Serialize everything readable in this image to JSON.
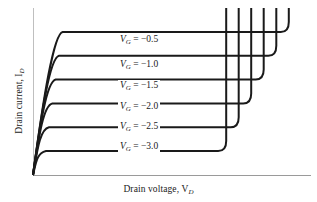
{
  "figure": {
    "x_axis_title_text": "Drain voltage, V",
    "x_axis_title_sub": "D",
    "y_axis_title_text": "Drain current, I",
    "y_axis_title_sub": "D"
  },
  "chart_data": {
    "type": "line",
    "title": "",
    "subtitle": "",
    "xlabel": "Drain voltage, V_D",
    "ylabel": "Drain current, I_D",
    "xlim": [
      0,
      10
    ],
    "ylim": [
      0,
      7
    ],
    "grid": false,
    "legend_position": "inline-annotations",
    "axis_ticks": [],
    "annotations": [
      {
        "label_var": "V",
        "label_sub": "G",
        "label_eq": " = ",
        "value": "−0.5"
      },
      {
        "label_var": "V",
        "label_sub": "G",
        "label_eq": " = ",
        "value": "−1.0"
      },
      {
        "label_var": "V",
        "label_sub": "G",
        "label_eq": " = ",
        "value": "−1.5"
      },
      {
        "label_var": "V",
        "label_sub": "G",
        "label_eq": " = ",
        "value": "−2.0"
      },
      {
        "label_var": "V",
        "label_sub": "G",
        "label_eq": " = ",
        "value": "−2.5"
      },
      {
        "label_var": "V",
        "label_sub": "G",
        "label_eq": " = ",
        "value": "−3.0"
      }
    ],
    "series": [
      {
        "name": "V_G = -0.5",
        "gate_voltage": -0.5,
        "saturation_current": 6.0,
        "knee_voltage": 0.85,
        "breakdown_voltage": 9.2,
        "color": "#1a1a1a"
      },
      {
        "name": "V_G = -1.0",
        "gate_voltage": -1.0,
        "saturation_current": 5.0,
        "knee_voltage": 0.72,
        "breakdown_voltage": 8.75,
        "color": "#1a1a1a"
      },
      {
        "name": "V_G = -1.5",
        "gate_voltage": -1.5,
        "saturation_current": 4.0,
        "knee_voltage": 0.6,
        "breakdown_voltage": 8.3,
        "color": "#1a1a1a"
      },
      {
        "name": "V_G = -2.0",
        "gate_voltage": -2.0,
        "saturation_current": 3.0,
        "knee_voltage": 0.48,
        "breakdown_voltage": 7.85,
        "color": "#1a1a1a"
      },
      {
        "name": "V_G = -2.5",
        "gate_voltage": -2.5,
        "saturation_current": 2.0,
        "knee_voltage": 0.36,
        "breakdown_voltage": 7.4,
        "color": "#1a1a1a"
      },
      {
        "name": "V_G = -3.0",
        "gate_voltage": -3.0,
        "saturation_current": 1.0,
        "knee_voltage": 0.25,
        "breakdown_voltage": 6.95,
        "color": "#1a1a1a"
      }
    ]
  },
  "style": {
    "curve_color": "#1a1a1a",
    "axis_color": "#9a9a9a",
    "background": "#ffffff"
  }
}
